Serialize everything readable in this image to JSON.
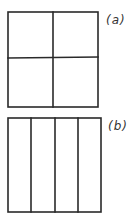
{
  "figures": [
    {
      "id": "a",
      "label": "(a)",
      "description": "Square divided into a 2x2 grid",
      "rows": 2,
      "cols": 2
    },
    {
      "id": "b",
      "label": "(b)",
      "description": "Square divided into 4 vertical strips",
      "rows": 1,
      "cols": 4
    }
  ],
  "colors": {
    "stroke": "#2a2a2a",
    "background": "#ffffff"
  }
}
